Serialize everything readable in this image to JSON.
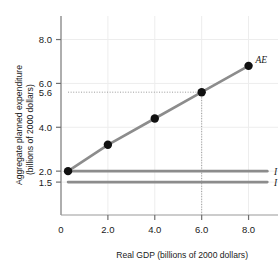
{
  "chart_data": {
    "type": "line",
    "title": "",
    "xlabel": "Real GDP (billions of 2000 dollars)",
    "ylabel": "Aggregate planned expenditure (billions of 2000 dollars)",
    "ylabel_line1": "Aggregate planned expenditure",
    "ylabel_line2": "(billions of 2000 dollars)",
    "xlim": [
      0,
      9.0
    ],
    "ylim": [
      0,
      8.8
    ],
    "xticks": [
      0,
      2.0,
      4.0,
      6.0,
      8.0
    ],
    "xticklabels": [
      "0",
      "2.0",
      "4.0",
      "6.0",
      "8.0"
    ],
    "yticks": [
      1.5,
      2.0,
      4.0,
      5.6,
      6.0,
      8.0
    ],
    "yticklabels": [
      "1.5",
      "2.0",
      "4.0",
      "5.6",
      "6.0",
      "8.0"
    ],
    "grid": true,
    "legend_position": "right-inline",
    "series": [
      {
        "name": "AE",
        "label": "AE",
        "color": "#8c8c8c",
        "marker": "circle",
        "marker_color": "#111111",
        "x": [
          0.3,
          2.0,
          4.0,
          6.0,
          8.0
        ],
        "values": [
          2.0,
          3.2,
          4.4,
          5.6,
          6.8
        ]
      },
      {
        "name": "I + G",
        "label": "I + G",
        "color": "#8c8c8c",
        "marker": "none",
        "x": [
          0.3,
          8.8
        ],
        "values": [
          2.0,
          2.0
        ]
      },
      {
        "name": "I",
        "label": "I",
        "color": "#8c8c8c",
        "marker": "none",
        "x": [
          0.3,
          8.8
        ],
        "values": [
          1.5,
          1.5
        ]
      }
    ],
    "annotations": [
      {
        "name": "equilibrium-guide-horizontal",
        "type": "dotted-hline",
        "y": 5.6,
        "x_from": 0.3,
        "x_to": 6.0,
        "label": "5.6"
      },
      {
        "name": "equilibrium-guide-vertical",
        "type": "dotted-vline",
        "x": 6.0,
        "y_from": 0,
        "y_to": 5.6,
        "label": "6.0"
      }
    ],
    "colors": {
      "line": "#8c8c8c",
      "marker": "#111111",
      "axis": "#8c8c8c",
      "grid": "#ededed",
      "guide": "#9a9a9a",
      "text": "#1a1a1a",
      "background": "#ffffff"
    }
  }
}
